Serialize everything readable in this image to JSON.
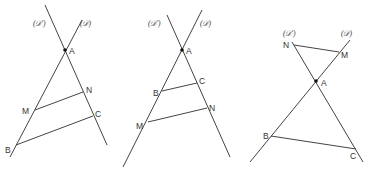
{
  "figures": [
    {
      "id": "figure-1",
      "line_labels": {
        "d_prime": "(𝒟')",
        "d": "(𝒟)"
      },
      "points": {
        "A": "A",
        "M": "M",
        "N": "N",
        "B": "B",
        "C": "C"
      }
    },
    {
      "id": "figure-2",
      "line_labels": {
        "d_prime": "(𝒟')",
        "d": "(𝒟)"
      },
      "points": {
        "A": "A",
        "B": "B",
        "C": "C",
        "M": "M",
        "N": "N"
      }
    },
    {
      "id": "figure-3",
      "line_labels": {
        "d_prime": "(𝒟')",
        "d": "(𝒟)"
      },
      "points": {
        "A": "A",
        "N": "N",
        "M": "M",
        "B": "B",
        "C": "C"
      }
    }
  ],
  "colors": {
    "stroke": "#444444",
    "text": "#333333",
    "background": "#ffffff"
  }
}
